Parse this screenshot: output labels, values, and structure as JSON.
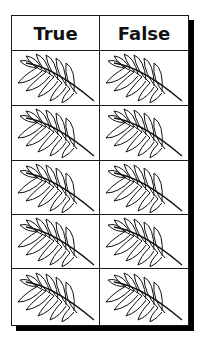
{
  "table": {
    "headers": [
      "True",
      "False"
    ],
    "rows": [
      {
        "true_icon": "wheat-ear-icon",
        "false_icon": "wheat-ear-icon"
      },
      {
        "true_icon": "wheat-ear-icon",
        "false_icon": "wheat-ear-icon"
      },
      {
        "true_icon": "wheat-ear-icon",
        "false_icon": "wheat-ear-icon"
      },
      {
        "true_icon": "wheat-ear-icon",
        "false_icon": "wheat-ear-icon"
      },
      {
        "true_icon": "wheat-ear-icon",
        "false_icon": "wheat-ear-icon"
      }
    ]
  }
}
